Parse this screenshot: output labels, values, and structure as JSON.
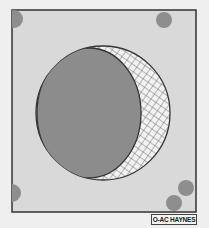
{
  "diagram": {
    "type": "technical-illustration",
    "colors": {
      "background": "#efefef",
      "panel": "#d9d9d9",
      "disc": "#8c8c8c",
      "hatch": "#555555",
      "outline": "#333333",
      "dots": "#8e8e8e"
    },
    "credit": "O-AC HAYNES"
  }
}
